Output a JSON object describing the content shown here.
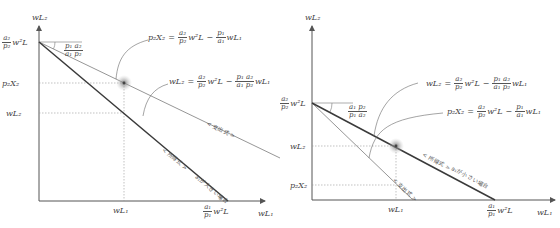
{
  "left_panel": {
    "axis_y_label": "wL₂",
    "axis_x_label": "wL₁",
    "y_intercept": {
      "num": "a₂",
      "den": "p₂",
      "rest": "w²L"
    },
    "x_intercept": {
      "num": "a₁",
      "den": "p₁",
      "rest": "w²L"
    },
    "tick_p2x2": "p₂X₂",
    "tick_wl2": "wL₂",
    "tick_wl1": "wL₁",
    "slope_angle": {
      "num": "p₁ a₂",
      "den": "a₁ p₂"
    },
    "eq_expenditure": {
      "lhs": "p₂X₂",
      "t1_num": "a₂",
      "t1_den": "p₂",
      "t1_rest": "w²L",
      "t2_num": "p₁",
      "t2_den": "a₁",
      "t2_rest": "wL₁"
    },
    "eq_income": {
      "lhs": "wL₂",
      "t1_num": "a₂",
      "t1_den": "p₂",
      "t1_rest": "w²L",
      "t2_num": "p₁ a₂",
      "t2_den": "a₁ p₂",
      "t2_rest": "wL₁"
    },
    "line_label_expenditure": "< 支出式 >",
    "line_label_income": "< 所得式 >",
    "case_label": "a₁が大きい場合"
  },
  "right_panel": {
    "axis_y_label": "wL₂",
    "axis_x_label": "wL₁",
    "y_intercept": {
      "num": "a₂",
      "den": "p₂",
      "rest": "w²L"
    },
    "x_intercept": {
      "num": "a₁",
      "den": "p₁",
      "rest": "w²L"
    },
    "tick_wl2": "wL₂",
    "tick_p2x2": "p₂X₂",
    "tick_wl1": "wL₁",
    "slope_angle": {
      "num": "a₁ p₂",
      "den": "p₁ a₂"
    },
    "eq_income": {
      "lhs": "wL₂",
      "t1_num": "a₂",
      "t1_den": "p₂",
      "t1_rest": "w²L",
      "t2_num": "p₁ a₂",
      "t2_den": "a₁ p₂",
      "t2_rest": "wL₁"
    },
    "eq_expenditure": {
      "lhs": "p₂X₂",
      "t1_num": "a₂",
      "t1_den": "p₂",
      "t1_rest": "w²L",
      "t2_num": "p₁",
      "t2_den": "a₁",
      "t2_rest": "wL₁"
    },
    "line_label_expenditure": "< 支出式 >",
    "line_label_income": "< 所得式 >",
    "case_label": "a₁が小さい場合"
  },
  "colors": {
    "axis": "#555555",
    "income_line": "#3a3a3a",
    "expenditure_line": "#8a8a8a",
    "guide": "#9a9a9a",
    "dot": "#555555",
    "halo": "#bbbbbb"
  }
}
